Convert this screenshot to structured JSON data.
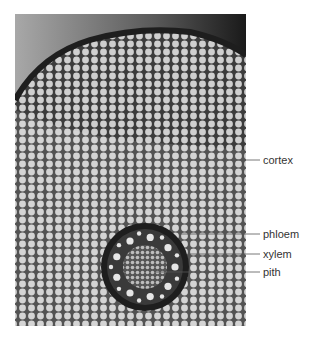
{
  "figure": {
    "labels": [
      {
        "id": "cortex",
        "text": "cortex"
      },
      {
        "id": "phloem",
        "text": "phloem"
      },
      {
        "id": "xylem",
        "text": "xylem"
      },
      {
        "id": "pith",
        "text": "pith"
      }
    ]
  },
  "colors": {
    "background": "#ffffff",
    "label_text": "#333333",
    "leader_line": "#555555",
    "cell_wall": "#3a3a3a",
    "cell_fill": "#c8c8c8",
    "stele_ring": "#1e1e1e"
  }
}
